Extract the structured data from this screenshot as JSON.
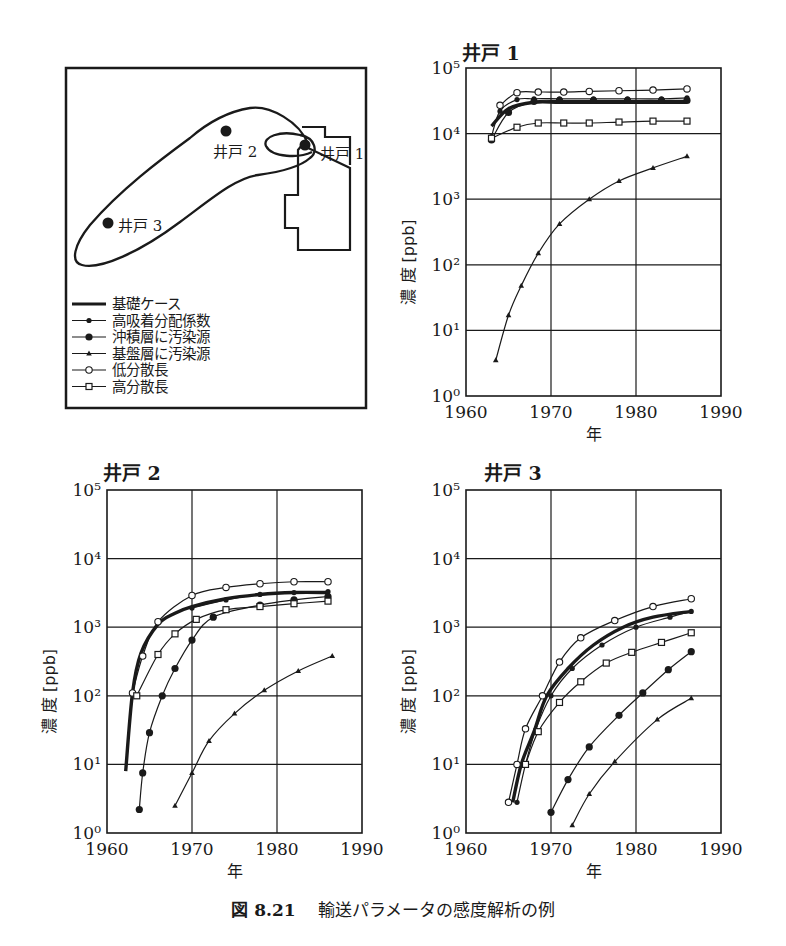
{
  "page_header_fragment": "",
  "map_panel": {
    "well_labels": [
      "井戸 1",
      "井戸 2",
      "井戸 3"
    ],
    "legend": [
      {
        "label": "基礎ケース",
        "marker": "thick-line"
      },
      {
        "label": "高吸着分配係数",
        "marker": "small-filled-circle"
      },
      {
        "label": "沖積層に汚染源",
        "marker": "filled-circle"
      },
      {
        "label": "基盤層に汚染源",
        "marker": "filled-triangle"
      },
      {
        "label": "低分散長",
        "marker": "open-circle"
      },
      {
        "label": "高分散長",
        "marker": "open-square"
      }
    ]
  },
  "caption": {
    "number": "図 8.21",
    "text": "輸送パラメータの感度解析の例"
  },
  "chart_data": [
    {
      "type": "line",
      "title": "井戸 1",
      "xlabel": "年",
      "ylabel": "濃 度 [ppb]",
      "yscale": "log",
      "xlim": [
        1960,
        1990
      ],
      "ylim": [
        1,
        100000
      ],
      "xticks": [
        "1960",
        "1970",
        "1980",
        "1990"
      ],
      "yticks": [
        "10^0",
        "10^1",
        "10^2",
        "10^3",
        "10^4",
        "10^5"
      ],
      "grid": true,
      "series": [
        {
          "name": "基礎ケース",
          "x": [
            1963,
            1965,
            1968,
            1971,
            1975,
            1979,
            1983,
            1986
          ],
          "values": [
            13000,
            24000,
            30000,
            30000,
            30000,
            30000,
            30000,
            30000
          ]
        },
        {
          "name": "高吸着分配係数",
          "x": [
            1963,
            1964,
            1966,
            1968,
            1971,
            1975,
            1979,
            1983,
            1986
          ],
          "values": [
            9000,
            22000,
            33000,
            34000,
            34000,
            34000,
            34000,
            34000,
            35000
          ]
        },
        {
          "name": "沖積層に汚染源",
          "x": [
            1963,
            1965,
            1968,
            1971,
            1975,
            1979,
            1983,
            1986
          ],
          "values": [
            8000,
            21000,
            31000,
            32000,
            32000,
            32000,
            32000,
            32000
          ]
        },
        {
          "name": "基盤層に汚染源",
          "x": [
            1963.5,
            1965,
            1966.5,
            1968.5,
            1971,
            1974.5,
            1978,
            1982,
            1986
          ],
          "values": [
            3.5,
            17,
            48,
            150,
            420,
            1000,
            1900,
            3000,
            4500
          ]
        },
        {
          "name": "低分散長",
          "x": [
            1964,
            1966,
            1968.5,
            1971.5,
            1974.5,
            1978,
            1982,
            1986
          ],
          "values": [
            27000,
            42000,
            43000,
            43000,
            44000,
            45000,
            46000,
            48000
          ]
        },
        {
          "name": "高分散長",
          "x": [
            1963,
            1966,
            1968.5,
            1971.5,
            1974.5,
            1978,
            1982,
            1986
          ],
          "values": [
            8500,
            12500,
            14500,
            14500,
            14500,
            15000,
            15500,
            15500
          ]
        }
      ]
    },
    {
      "type": "line",
      "title": "井戸 2",
      "xlabel": "年",
      "ylabel": "濃 度 [ppb]",
      "yscale": "log",
      "xlim": [
        1960,
        1990
      ],
      "ylim": [
        1,
        100000
      ],
      "xticks": [
        "1960",
        "1970",
        "1980",
        "1990"
      ],
      "yticks": [
        "10^0",
        "10^1",
        "10^2",
        "10^3",
        "10^4",
        "10^5"
      ],
      "grid": true,
      "series": [
        {
          "name": "基礎ケース",
          "x": [
            1962.2,
            1963,
            1964,
            1966,
            1968,
            1970,
            1974,
            1978,
            1982,
            1986
          ],
          "values": [
            8,
            110,
            420,
            1100,
            1600,
            2000,
            2600,
            3000,
            3200,
            3200
          ]
        },
        {
          "name": "高吸着分配係数",
          "x": [
            1970,
            1974,
            1978,
            1982,
            1986
          ],
          "values": [
            1900,
            2500,
            3000,
            3200,
            3300
          ]
        },
        {
          "name": "沖積層に汚染源",
          "x": [
            1963.8,
            1964.2,
            1965,
            1966.5,
            1968,
            1970,
            1972.5,
            1978,
            1982,
            1986
          ],
          "values": [
            2.2,
            7.5,
            29,
            100,
            250,
            650,
            1400,
            2100,
            2500,
            2800
          ]
        },
        {
          "name": "基盤層に汚染源",
          "x": [
            1968,
            1970,
            1972,
            1975,
            1978.5,
            1982.5,
            1986.5
          ],
          "values": [
            2.5,
            7.5,
            22,
            55,
            120,
            230,
            380
          ]
        },
        {
          "name": "低分散長",
          "x": [
            1963,
            1964.2,
            1966,
            1970,
            1974,
            1978,
            1982,
            1986
          ],
          "values": [
            110,
            380,
            1200,
            2900,
            3800,
            4300,
            4600,
            4600
          ]
        },
        {
          "name": "高分散長",
          "x": [
            1963.5,
            1966,
            1968,
            1970.5,
            1974,
            1978,
            1982,
            1986
          ],
          "values": [
            100,
            400,
            800,
            1300,
            1800,
            2000,
            2200,
            2400
          ]
        }
      ]
    },
    {
      "type": "line",
      "title": "井戸 3",
      "xlabel": "年",
      "ylabel": "濃 度 [ppb]",
      "yscale": "log",
      "xlim": [
        1960,
        1990
      ],
      "ylim": [
        1,
        100000
      ],
      "xticks": [
        "1960",
        "1970",
        "1980",
        "1990"
      ],
      "yticks": [
        "10^0",
        "10^1",
        "10^2",
        "10^3",
        "10^4",
        "10^5"
      ],
      "grid": true,
      "series": [
        {
          "name": "基礎ケース",
          "x": [
            1965.5,
            1966.5,
            1968,
            1969.5,
            1972,
            1975,
            1978.5,
            1982,
            1986.5
          ],
          "values": [
            2.8,
            10,
            30,
            100,
            250,
            550,
            1000,
            1400,
            1700
          ]
        },
        {
          "name": "高吸着分配係数",
          "x": [
            1966,
            1967,
            1968.2,
            1970,
            1972.5,
            1976,
            1980,
            1984,
            1986.5
          ],
          "values": [
            2.8,
            10,
            32,
            100,
            250,
            550,
            1000,
            1400,
            1700
          ]
        },
        {
          "name": "沖積層に汚染源",
          "x": [
            1970,
            1972,
            1974.5,
            1978,
            1980.8,
            1983.8,
            1986.5
          ],
          "values": [
            2,
            6,
            18,
            52,
            110,
            240,
            440
          ]
        },
        {
          "name": "基盤層に汚染源",
          "x": [
            1972.5,
            1974.5,
            1977.5,
            1982.5,
            1986.5
          ],
          "values": [
            1.3,
            3.7,
            11,
            45,
            92
          ]
        },
        {
          "name": "低分散長",
          "x": [
            1965,
            1966,
            1967,
            1969,
            1971,
            1973.5,
            1977.5,
            1982,
            1986.5
          ],
          "values": [
            2.8,
            10,
            33,
            100,
            310,
            700,
            1250,
            2000,
            2600
          ]
        },
        {
          "name": "高分散長",
          "x": [
            1967,
            1968.5,
            1971,
            1973.5,
            1976.5,
            1979.5,
            1983,
            1986.5
          ],
          "values": [
            10,
            30,
            80,
            160,
            300,
            430,
            600,
            830
          ]
        }
      ]
    }
  ]
}
